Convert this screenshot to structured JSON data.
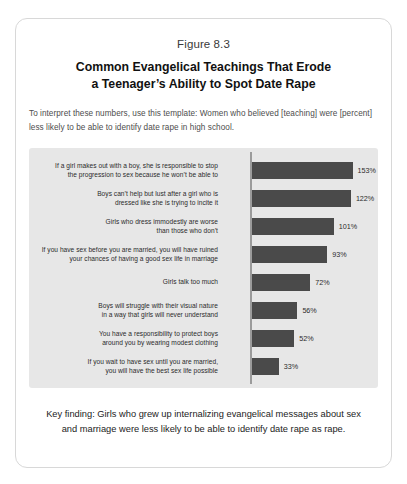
{
  "figure": {
    "number": "Figure 8.3",
    "title_line1": "Common Evangelical Teachings That Erode",
    "title_line2": "a Teenager’s Ability to Spot Date Rape",
    "subtitle": "To interpret these numbers, use this template: Women who believed [teaching] were [percent] less likely to be able to identify date rape in high school.",
    "footer": "Key finding: Girls who grew up internalizing evangelical messages about sex and marriage were less likely to be able to identify date rape as rape."
  },
  "colors": {
    "bar": "#4a4a4a",
    "panel": "#e7e7e7",
    "axis": "#9b9b9b",
    "card_border": "#d8d8d8"
  },
  "chart_data": {
    "type": "bar",
    "orientation": "horizontal",
    "title": "Common Evangelical Teachings That Erode a Teenager’s Ability to Spot Date Rape",
    "subtitle": "To interpret these numbers, use this template: Women who believed [teaching] were [percent] less likely to be able to identify date rape in high school.",
    "xlabel": "",
    "ylabel": "",
    "xlim": [
      0,
      153
    ],
    "grid": false,
    "legend": "none",
    "categories": [
      "If a girl makes out with a boy, she is responsible to stop the progression to sex because he won’t be able to",
      "Boys can’t help but lust after a girl who is dressed like she is trying to incite it",
      "Girls who dress immodestly are worse than those who don’t",
      "If you have sex before you are married, you will have ruined your chances of having a good sex life in marriage",
      "Girls talk too much",
      "Boys will struggle with their visual nature in a way that girls will never understand",
      "You have a responsibility to protect boys around you by wearing modest clothing",
      "If you wait to have sex until you are married, you will have the best sex life possible"
    ],
    "values": [
      153,
      122,
      101,
      93,
      72,
      56,
      52,
      33
    ],
    "value_labels": [
      "153%",
      "122%",
      "101%",
      "93%",
      "72%",
      "56%",
      "52%",
      "33%"
    ],
    "bars": [
      {
        "label_line1": "If a girl makes out with a boy, she is responsible to stop",
        "label_line2": "the progression to sex because he won’t be able to",
        "value": 153,
        "value_label": "153%"
      },
      {
        "label_line1": "Boys can’t help but lust after a girl who is",
        "label_line2": "dressed like she is trying to incite it",
        "value": 122,
        "value_label": "122%"
      },
      {
        "label_line1": "Girls who dress immodestly are worse",
        "label_line2": "than those who don’t",
        "value": 101,
        "value_label": "101%"
      },
      {
        "label_line1": "If you have sex before you are married, you will have ruined",
        "label_line2": "your chances of having a good sex life in marriage",
        "value": 93,
        "value_label": "93%"
      },
      {
        "label_line1": "Girls talk too much",
        "label_line2": "",
        "value": 72,
        "value_label": "72%"
      },
      {
        "label_line1": "Boys will struggle with their visual nature",
        "label_line2": "in a way that girls will never understand",
        "value": 56,
        "value_label": "56%"
      },
      {
        "label_line1": "You have a responsibility to protect boys",
        "label_line2": "around you by wearing modest clothing",
        "value": 52,
        "value_label": "52%"
      },
      {
        "label_line1": "If you wait to have sex until you are married,",
        "label_line2": "you will have the best sex life possible",
        "value": 33,
        "value_label": "33%"
      }
    ]
  }
}
